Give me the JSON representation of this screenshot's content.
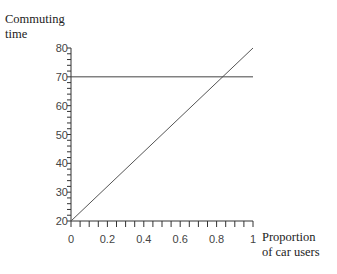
{
  "chart_data": {
    "type": "line",
    "title": "",
    "ylabel": "Commuting time",
    "ylabel_lines": [
      "Commuting",
      "time"
    ],
    "xlabel": "Proportion of car users",
    "xlabel_lines": [
      "Proportion",
      "of car users"
    ],
    "xlim": [
      0,
      1
    ],
    "ylim": [
      20,
      80
    ],
    "xticks": [
      "0",
      "0.2",
      "0.4",
      "0.6",
      "0.8",
      "1"
    ],
    "yticks": [
      "20",
      "30",
      "40",
      "50",
      "60",
      "70",
      "80"
    ],
    "grid": false,
    "legend": null,
    "series": [
      {
        "name": "car commuting time",
        "x": [
          0,
          1
        ],
        "y": [
          20,
          80
        ]
      },
      {
        "name": "constant commuting time",
        "x": [
          0,
          1
        ],
        "y": [
          70,
          70
        ]
      }
    ]
  }
}
